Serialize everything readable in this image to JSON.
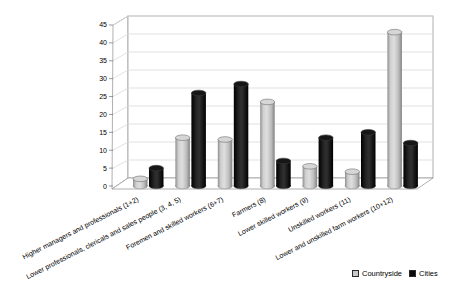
{
  "chart_data": {
    "type": "bar",
    "style": "3d-cylinder",
    "title": "",
    "xlabel": "",
    "ylabel": "",
    "categories": [
      "Higher managers and professionals (1+2)",
      "Lower professionals, clericals and sales people (3, 4, 5)",
      "Foremen and skilled workers (6+7)",
      "Farmers (8)",
      "Lower skilled workers (9)",
      "Unskilled workers (11)",
      "Lower and unskilled farm workers (10+12)"
    ],
    "series": [
      {
        "name": "Countryside",
        "color": "#c9c9c9",
        "values": [
          2,
          13.5,
          13,
          23.5,
          5.5,
          4,
          43
        ]
      },
      {
        "name": "Cities",
        "color": "#0a0a0a",
        "values": [
          5,
          26,
          28.5,
          7,
          13.5,
          15,
          12
        ]
      }
    ],
    "ylim": [
      0,
      45
    ],
    "ytick_step": 5,
    "yticks": [
      0,
      5,
      10,
      15,
      20,
      25,
      30,
      35,
      40,
      45
    ],
    "grid": true,
    "legend_position": "bottom-right",
    "colors": {
      "gridline": "#d9d9d9",
      "frame": "#9c9c9c",
      "text": "#000000",
      "background": "#ffffff"
    }
  }
}
